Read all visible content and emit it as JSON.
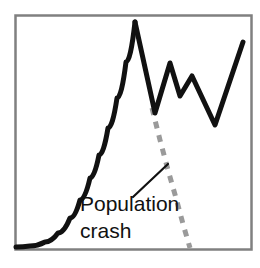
{
  "figure": {
    "title": "",
    "background_color": "#ffffff",
    "frame_color": "#808080",
    "frame_width": 2
  },
  "annotation": {
    "line1": "Population",
    "line2": "crash",
    "text_color": "#111111",
    "leader_line_color": "#111111"
  },
  "chart_data": {
    "type": "line",
    "title": "",
    "subtitle": "",
    "xlabel": "",
    "ylabel": "",
    "xlim": [
      0,
      260
    ],
    "ylim": [
      0,
      268
    ],
    "grid": false,
    "legend": null,
    "axis_ticks": {
      "x": [],
      "y": []
    },
    "series": [
      {
        "name": "Population (growth then oscillation)",
        "style": "solid",
        "color": "#111111",
        "width": 5,
        "points": [
          [
            16,
            247
          ],
          [
            30,
            246
          ],
          [
            45,
            242
          ],
          [
            58,
            233
          ],
          [
            70,
            218
          ],
          [
            80,
            200
          ],
          [
            90,
            178
          ],
          [
            99,
            155
          ],
          [
            108,
            128
          ],
          [
            117,
            98
          ],
          [
            126,
            62
          ],
          [
            135,
            22
          ],
          [
            155,
            113
          ],
          [
            170,
            63
          ],
          [
            180,
            96
          ],
          [
            192,
            76
          ],
          [
            215,
            125
          ],
          [
            243,
            42
          ]
        ]
      },
      {
        "name": "Population crash trajectory",
        "style": "dashed",
        "color": "#9a9a9a",
        "width": 5,
        "dash": [
          7,
          7
        ],
        "points": [
          [
            152,
            108
          ],
          [
            160,
            140
          ],
          [
            168,
            170
          ],
          [
            176,
            198
          ],
          [
            183,
            224
          ],
          [
            190,
            248
          ]
        ]
      }
    ],
    "annotations": [
      {
        "text": "Population crash",
        "text_x": 80,
        "text_y": 210,
        "leader_from": [
          133,
          197
        ],
        "leader_to": [
          168,
          164
        ]
      }
    ]
  }
}
